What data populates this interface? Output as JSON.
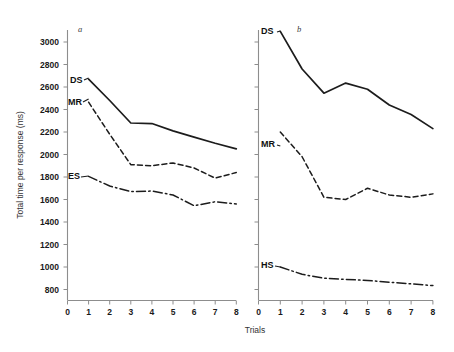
{
  "chart_data": {
    "type": "line",
    "title": "",
    "xlabel": "Trials",
    "ylabel": "Total time per response (ms)",
    "ylim": [
      700,
      3100
    ],
    "xlim": [
      0,
      8
    ],
    "y_ticks": [
      800,
      1000,
      1200,
      1400,
      1600,
      1800,
      2000,
      2200,
      2400,
      2600,
      2800,
      3000
    ],
    "x_ticks": [
      0,
      1,
      2,
      3,
      4,
      5,
      6,
      7,
      8
    ],
    "grid": false,
    "legend_position": "inline-label-left",
    "panels": [
      {
        "panel_label": "a",
        "x": [
          1,
          2,
          3,
          4,
          5,
          6,
          7,
          8
        ],
        "series": [
          {
            "name": "DS",
            "style": "solid",
            "label": "DS",
            "values": [
              2670,
              2480,
              2280,
              2275,
              2210,
              2155,
              2100,
              2050
            ]
          },
          {
            "name": "MR",
            "style": "dashed",
            "label": "MR",
            "values": [
              2465,
              2180,
              1910,
              1900,
              1925,
              1880,
              1790,
              1840
            ]
          },
          {
            "name": "ES",
            "style": "dashdot",
            "label": "ES",
            "values": [
              1805,
              1720,
              1670,
              1675,
              1640,
              1545,
              1580,
              1560
            ]
          }
        ]
      },
      {
        "panel_label": "b",
        "x": [
          1,
          2,
          3,
          4,
          5,
          6,
          7,
          8
        ],
        "series": [
          {
            "name": "DS",
            "style": "solid",
            "label": "DS",
            "values": [
              3095,
              2760,
              2545,
              2635,
              2580,
              2440,
              2355,
              2230
            ]
          },
          {
            "name": "MR",
            "style": "dashed",
            "label": "MR",
            "values": [
              2200,
              1980,
              1620,
              1600,
              1700,
              1640,
              1620,
              1650
            ]
          },
          {
            "name": "HS",
            "style": "dashdot",
            "label": "HS",
            "values": [
              1000,
              935,
              900,
              890,
              880,
              865,
              850,
              835
            ]
          }
        ]
      }
    ]
  },
  "axis": {
    "y_title": "Total time per response (ms)",
    "x_title": "Trials",
    "y_tick_labels": [
      "3000",
      "2800",
      "2600",
      "2400",
      "2200",
      "2000",
      "1800",
      "1600",
      "1400",
      "1200",
      "1000",
      "800"
    ],
    "x_tick_labels_panel_a": [
      "0",
      "1",
      "2",
      "3",
      "4",
      "5",
      "6",
      "7",
      "8"
    ],
    "x_tick_labels_panel_b": [
      "0",
      "1",
      "2",
      "3",
      "4",
      "5",
      "6",
      "7",
      "8"
    ]
  },
  "labels": {
    "panel_a": "a",
    "panel_b": "b",
    "a_ds": "DS",
    "a_mr": "MR",
    "a_es": "ES",
    "b_ds": "DS",
    "b_mr": "MR",
    "b_hs": "HS"
  },
  "colors": {
    "ink": "#1c1c1c",
    "axis": "#8d8d8d",
    "background": "#ffffff"
  }
}
